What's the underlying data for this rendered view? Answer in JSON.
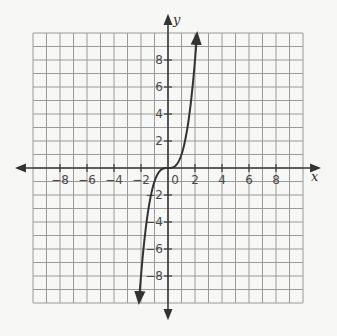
{
  "chart_data": {
    "type": "line",
    "title": "",
    "xlabel": "x",
    "ylabel": "y",
    "xlim": [
      -10,
      10
    ],
    "ylim": [
      -10,
      10
    ],
    "grid": true,
    "grid_step": 1,
    "x_ticks": [
      -8,
      -6,
      -4,
      -2,
      0,
      2,
      4,
      6,
      8
    ],
    "y_ticks": [
      -8,
      -6,
      -4,
      -2,
      2,
      4,
      6,
      8
    ],
    "x_tick_labels": [
      "-8",
      "-6",
      "-4",
      "-2",
      "0",
      "2",
      "4",
      "6",
      "8"
    ],
    "y_tick_labels": [
      "-8",
      "-6",
      "-4",
      "-2",
      "2",
      "4",
      "6",
      "8"
    ],
    "series": [
      {
        "name": "y = x^3",
        "x": [
          -2.15,
          -2,
          -1.5,
          -1,
          -0.5,
          0,
          0.5,
          1,
          1.5,
          2,
          2.15
        ],
        "y": [
          -9.94,
          -8,
          -3.375,
          -1,
          -0.125,
          0,
          0.125,
          1,
          3.375,
          8,
          9.94
        ],
        "arrows_at_ends": true
      }
    ],
    "axes_arrows": true
  },
  "labels": {
    "x_axis": "x",
    "y_axis": "y",
    "origin": "0"
  },
  "colors": {
    "grid": "#9a9a9a",
    "axis": "#3a3a3a",
    "curve": "#333333",
    "background": "#f7f7f5"
  }
}
